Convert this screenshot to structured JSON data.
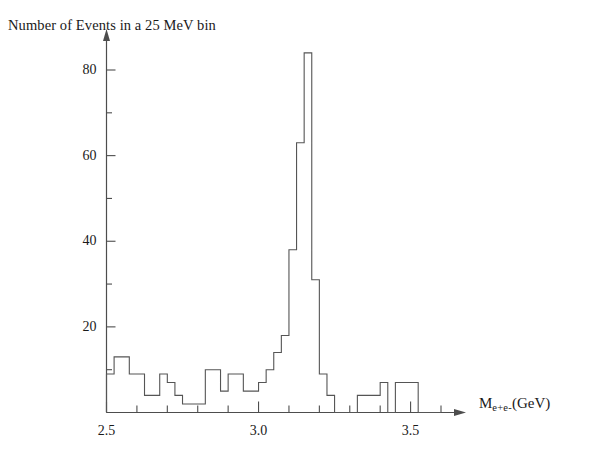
{
  "chart_data": {
    "type": "bar",
    "title": "",
    "subtitle": "",
    "ylabel": "Number of Events in a 25 MeV bin",
    "xlabel": "M_{e+e-} (GeV)",
    "xlabel_parts": {
      "symbol": "M",
      "subscript": "e+e-",
      "unit": "(GeV)"
    },
    "bin_width": 0.025,
    "bin_width_text": "25 MeV",
    "xlim": [
      2.5,
      3.6
    ],
    "ylim": [
      0,
      90
    ],
    "grid": false,
    "legend": null,
    "x_ticks_major": [
      2.5,
      3.0,
      3.5
    ],
    "x_tick_labels": [
      "2.5",
      "3.0",
      "3.5"
    ],
    "x_ticks_minor": [
      2.6,
      2.7,
      2.8,
      2.9,
      3.1,
      3.2,
      3.3,
      3.4,
      3.6
    ],
    "y_ticks_major": [
      20,
      40,
      60,
      80
    ],
    "y_tick_labels": [
      "20",
      "40",
      "60",
      "80"
    ],
    "y_ticks_minor": [
      10,
      30,
      50,
      70
    ],
    "bin_edges_start": 2.5,
    "categories": [
      "2.500",
      "2.525",
      "2.550",
      "2.575",
      "2.600",
      "2.625",
      "2.650",
      "2.675",
      "2.700",
      "2.725",
      "2.750",
      "2.775",
      "2.800",
      "2.825",
      "2.850",
      "2.875",
      "2.900",
      "2.925",
      "2.950",
      "2.975",
      "3.000",
      "3.025",
      "3.050",
      "3.075",
      "3.100",
      "3.125",
      "3.150",
      "3.175",
      "3.200",
      "3.225",
      "3.250",
      "3.275",
      "3.300",
      "3.325",
      "3.350",
      "3.375",
      "3.400",
      "3.425",
      "3.450",
      "3.475",
      "3.500",
      "3.525",
      "3.550",
      "3.575"
    ],
    "values": [
      9,
      13,
      13,
      9,
      9,
      4,
      4,
      9,
      7,
      4,
      2,
      2,
      2,
      10,
      10,
      5,
      9,
      9,
      5,
      5,
      7,
      10,
      14,
      18,
      38,
      63,
      84,
      31,
      9,
      4,
      0,
      0,
      0,
      4,
      4,
      4,
      7,
      0,
      7,
      7,
      7,
      0,
      0,
      0
    ],
    "peak": {
      "bin_center": 3.1125,
      "value": 84
    },
    "line_color": "#555555",
    "axis_color": "#4d4d4d",
    "text_color": "#1a1a1a"
  }
}
